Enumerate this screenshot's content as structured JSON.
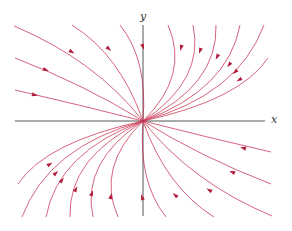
{
  "figure": {
    "type": "phase-portrait",
    "x_axis_label": "x",
    "y_axis_label": "y",
    "origin_px": [
      143,
      121
    ],
    "colors": {
      "trajectory": "#c8284a",
      "axis": "#555555",
      "background": "#ffffff"
    },
    "trajectory_count": 24,
    "flow_direction": "toward origin",
    "arrow_marker": "small filled arrowhead at mid-curve"
  }
}
